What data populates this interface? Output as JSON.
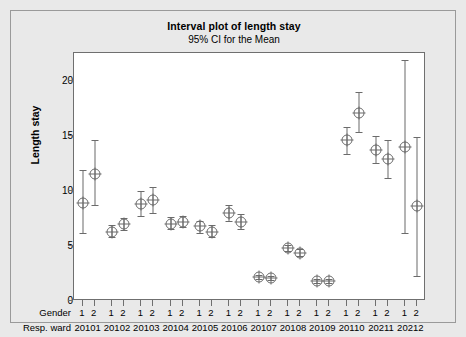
{
  "chart_data": {
    "type": "scatter",
    "title": "Interval plot of length stay",
    "subtitle": "95% CI for the Mean",
    "ylabel": "Length stay",
    "xlabel": "",
    "ylim": [
      0,
      22.5
    ],
    "yticks": [
      0,
      5,
      10,
      15,
      20
    ],
    "grid": false,
    "legend": null,
    "group_row_labels": {
      "gender": "Gender",
      "ward": "Resp. ward"
    },
    "wards": [
      "20101",
      "20102",
      "20103",
      "20104",
      "20105",
      "20106",
      "20107",
      "20108",
      "20109",
      "20110",
      "20211",
      "20212"
    ],
    "genders": [
      "1",
      "2"
    ],
    "points": [
      {
        "ward": "20101",
        "gender": "1",
        "mean": 8.9,
        "ci_low": 6.2,
        "ci_high": 11.9
      },
      {
        "ward": "20101",
        "gender": "2",
        "mean": 11.5,
        "ci_low": 8.7,
        "ci_high": 14.6
      },
      {
        "ward": "20102",
        "gender": "1",
        "mean": 6.3,
        "ci_low": 5.8,
        "ci_high": 6.9
      },
      {
        "ward": "20102",
        "gender": "2",
        "mean": 7.0,
        "ci_low": 6.4,
        "ci_high": 7.5
      },
      {
        "ward": "20103",
        "gender": "1",
        "mean": 8.8,
        "ci_low": 7.7,
        "ci_high": 10.0
      },
      {
        "ward": "20103",
        "gender": "2",
        "mean": 9.2,
        "ci_low": 8.0,
        "ci_high": 10.3
      },
      {
        "ward": "20104",
        "gender": "1",
        "mean": 7.0,
        "ci_low": 6.5,
        "ci_high": 7.6
      },
      {
        "ward": "20104",
        "gender": "2",
        "mean": 7.2,
        "ci_low": 6.7,
        "ci_high": 7.7
      },
      {
        "ward": "20105",
        "gender": "1",
        "mean": 6.8,
        "ci_low": 6.2,
        "ci_high": 7.3
      },
      {
        "ward": "20105",
        "gender": "2",
        "mean": 6.3,
        "ci_low": 5.8,
        "ci_high": 6.9
      },
      {
        "ward": "20106",
        "gender": "1",
        "mean": 8.0,
        "ci_low": 7.3,
        "ci_high": 8.7
      },
      {
        "ward": "20106",
        "gender": "2",
        "mean": 7.2,
        "ci_low": 6.5,
        "ci_high": 7.9
      },
      {
        "ward": "20107",
        "gender": "1",
        "mean": 2.2,
        "ci_low": 2.0,
        "ci_high": 2.4
      },
      {
        "ward": "20107",
        "gender": "2",
        "mean": 2.1,
        "ci_low": 1.9,
        "ci_high": 2.3
      },
      {
        "ward": "20108",
        "gender": "1",
        "mean": 4.8,
        "ci_low": 4.5,
        "ci_high": 5.1
      },
      {
        "ward": "20108",
        "gender": "2",
        "mean": 4.4,
        "ci_low": 4.1,
        "ci_high": 4.7
      },
      {
        "ward": "20109",
        "gender": "1",
        "mean": 1.8,
        "ci_low": 1.6,
        "ci_high": 2.0
      },
      {
        "ward": "20109",
        "gender": "2",
        "mean": 1.8,
        "ci_low": 1.6,
        "ci_high": 2.0
      },
      {
        "ward": "20110",
        "gender": "1",
        "mean": 14.6,
        "ci_low": 13.3,
        "ci_high": 15.8
      },
      {
        "ward": "20110",
        "gender": "2",
        "mean": 17.1,
        "ci_low": 15.3,
        "ci_high": 19.0
      },
      {
        "ward": "20211",
        "gender": "1",
        "mean": 13.7,
        "ci_low": 12.5,
        "ci_high": 15.0
      },
      {
        "ward": "20211",
        "gender": "2",
        "mean": 12.9,
        "ci_low": 11.2,
        "ci_high": 14.6
      },
      {
        "ward": "20212",
        "gender": "1",
        "mean": 14.0,
        "ci_low": 6.2,
        "ci_high": 21.9
      },
      {
        "ward": "20212",
        "gender": "2",
        "mean": 8.6,
        "ci_low": 2.3,
        "ci_high": 14.9
      }
    ]
  },
  "colors": {
    "panel_background": "#e9e9e9",
    "plot_background": "#ffffff",
    "axis": "#6f6f6f",
    "marker": "#6b6b6b",
    "text": "#000000"
  }
}
